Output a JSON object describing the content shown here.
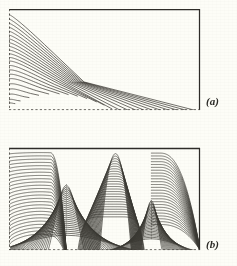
{
  "figure": {
    "type": "contour-plot-figure",
    "background_color": "#fdfdf7",
    "line_color": "#3a3832",
    "border_color": "#2e2c28",
    "panels": [
      {
        "id": "a",
        "label": "(a)",
        "frame": {
          "x": 9,
          "y": 9,
          "width": 191,
          "height": 101
        },
        "left_edge_style": "dashed",
        "bottom_edge_style": "dashed",
        "top_edge_style": "solid",
        "right_edge_style": "solid",
        "contour_count": 22,
        "description": "Nested contours running horizontally from the dashed left edge, turning downward near the solid right edge; curves converge toward the lower-left corner."
      },
      {
        "id": "b",
        "label": "(b)",
        "frame": {
          "x": 9,
          "y": 148,
          "width": 191,
          "height": 102
        },
        "left_edge_style": "dashed",
        "bottom_edge_style": "dashed",
        "top_edge_style": "solid",
        "right_edge_style": "solid",
        "contour_count": 26,
        "description": "Nested contours forming a central saddle arch with two clear dome-shaped voids rising from the dashed bottom edge, dense vertical lines between the domes and along the right border."
      }
    ]
  },
  "chart_data": {
    "type": "line",
    "title": "",
    "xlabel": "",
    "ylabel": "",
    "grid": false,
    "legend": "none",
    "panels": [
      {
        "name": "(a)",
        "xlim": [
          0,
          1
        ],
        "ylim": [
          0,
          1
        ],
        "levels": [
          0.02,
          0.06,
          0.1,
          0.14,
          0.18,
          0.22,
          0.26,
          0.3,
          0.34,
          0.38,
          0.42,
          0.46,
          0.5,
          0.55,
          0.6,
          0.65,
          0.7,
          0.76,
          0.82,
          0.88,
          0.94,
          0.98
        ]
      },
      {
        "name": "(b)",
        "xlim": [
          0,
          1
        ],
        "ylim": [
          0,
          1
        ],
        "levels": [
          0.02,
          0.05,
          0.09,
          0.13,
          0.17,
          0.21,
          0.25,
          0.29,
          0.33,
          0.37,
          0.41,
          0.45,
          0.49,
          0.53,
          0.57,
          0.61,
          0.65,
          0.69,
          0.73,
          0.77,
          0.81,
          0.85,
          0.89,
          0.93,
          0.96,
          0.99
        ]
      }
    ]
  }
}
